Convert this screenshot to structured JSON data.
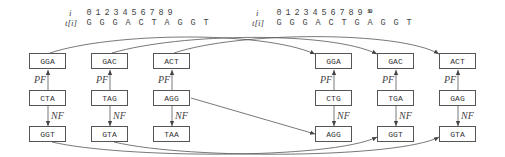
{
  "left_string": {
    "index_label": "i",
    "text_label": "t[i]",
    "indices": [
      "0",
      "1",
      "2",
      "3",
      "4",
      "5",
      "6",
      "7",
      "8",
      "9"
    ],
    "chars": [
      "G",
      "G",
      "G",
      "A",
      "C",
      "T",
      "A",
      "G",
      "G",
      "T"
    ]
  },
  "right_string": {
    "index_label": "i",
    "text_label": "t[i]",
    "indices": [
      "0",
      "1",
      "2",
      "3",
      "4",
      "5",
      "6",
      "7",
      "8",
      "9",
      "10"
    ],
    "chars": [
      "G",
      "G",
      "G",
      "A",
      "C",
      "T",
      "G",
      "A",
      "G",
      "G",
      "T"
    ]
  },
  "edge_labels": {
    "pf": "PF",
    "nf": "NF"
  },
  "left_groups": [
    {
      "top": "GGA",
      "mid": "CTA",
      "bottom": "GGT"
    },
    {
      "top": "GAC",
      "mid": "TAG",
      "bottom": "GTA"
    },
    {
      "top": "ACT",
      "mid": "AGG",
      "bottom": "TAA"
    }
  ],
  "right_groups": [
    {
      "top": "GGA",
      "mid": "CTG",
      "bottom": "AGG"
    },
    {
      "top": "GAC",
      "mid": "TGA",
      "bottom": "GGT"
    },
    {
      "top": "ACT",
      "mid": "GAG",
      "bottom": "GTA"
    }
  ],
  "cross_edges": [
    {
      "from": "left.GGA(top)",
      "to": "right.GGA(top)"
    },
    {
      "from": "left.GAC(top)",
      "to": "right.GAC(top)"
    },
    {
      "from": "left.ACT(top)",
      "to": "right.ACT(top)"
    },
    {
      "from": "left.AGG(mid)",
      "to": "right.AGG(bottom)"
    },
    {
      "from": "left.GGT(bottom)",
      "to": "right.GGT(bottom)"
    },
    {
      "from": "left.GTA(bottom)",
      "to": "right.GTA(bottom)"
    }
  ]
}
